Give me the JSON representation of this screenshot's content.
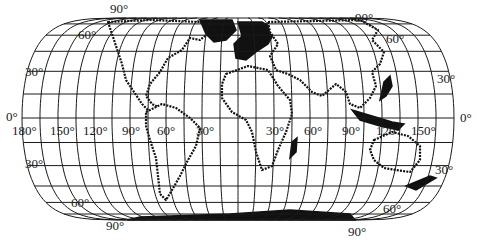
{
  "map": {
    "projection_hint": "pseudocylindrical world map with flat poles",
    "graticule_spacing_deg": 15,
    "colors": {
      "background": "#ffffff",
      "lines": "#1a1a1a",
      "land_outline": "#111111"
    },
    "geometry": {
      "center_x": 238,
      "equator_y": 118,
      "equator_half_width": 216,
      "north_pole_y": 18,
      "south_pole_y": 220,
      "pole_half_width": 122
    }
  },
  "labels": {
    "north_90_left": "90°",
    "north_90_right": "90°",
    "north_60_left": "60°",
    "north_60_right": "60°",
    "north_30_left": "30°",
    "north_30_right": "30°",
    "equator_left": "0°",
    "equator_right": "0°",
    "south_30_left": "30°",
    "south_30_right": "30°",
    "south_60_left": "60°",
    "south_60_right": "60°",
    "south_90_left": "90°",
    "south_90_right": "90°",
    "lon_180": "180°",
    "lon_150w": "150°",
    "lon_120w": "120°",
    "lon_90w": "90°",
    "lon_60w": "60°",
    "lon_30w": "30°",
    "lon_30e": "30°",
    "lon_60e": "60°",
    "lon_90e": "90°",
    "lon_120e": "120°",
    "lon_150e": "150°"
  }
}
